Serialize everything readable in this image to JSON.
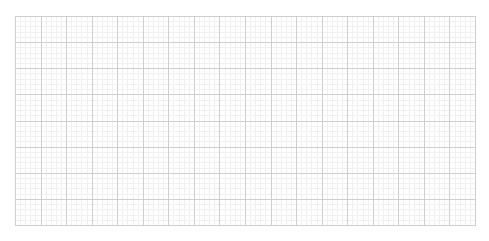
{
  "chart_data": {
    "type": "line",
    "title": "",
    "xlabel": "",
    "ylabel": "",
    "series": [],
    "grid": {
      "on": true,
      "major_columns": 18,
      "major_rows": 8,
      "minor_subdivisions": 5,
      "major_color": "#cfcfcf",
      "minor_color": "#f0f0f0",
      "border_color": "#cfcfcf"
    },
    "legend": null
  }
}
